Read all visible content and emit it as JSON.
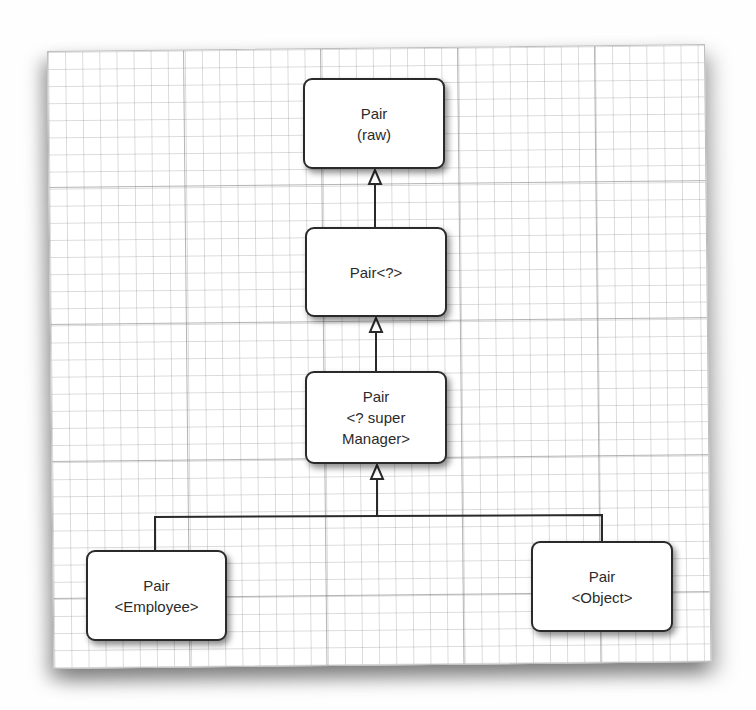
{
  "diagram": {
    "type": "class-hierarchy",
    "nodes": [
      {
        "id": "pair-raw",
        "lines": [
          "Pair",
          "(raw)"
        ]
      },
      {
        "id": "pair-wildcard",
        "lines": [
          "Pair<?>"
        ]
      },
      {
        "id": "pair-super-manager",
        "lines": [
          "Pair",
          "<? super",
          "Manager>"
        ]
      },
      {
        "id": "pair-employee",
        "lines": [
          "Pair",
          "<Employee>"
        ]
      },
      {
        "id": "pair-object",
        "lines": [
          "Pair",
          "<Object>"
        ]
      }
    ],
    "edges": [
      {
        "from": "pair-wildcard",
        "to": "pair-raw",
        "style": "generalization"
      },
      {
        "from": "pair-super-manager",
        "to": "pair-wildcard",
        "style": "generalization"
      },
      {
        "from": "pair-employee",
        "to": "pair-super-manager",
        "style": "generalization"
      },
      {
        "from": "pair-object",
        "to": "pair-super-manager",
        "style": "generalization"
      }
    ],
    "colors": {
      "line": "#2a2a2a",
      "box_fill": "#ffffff",
      "text": "#2b2b2b",
      "grid": "#9a9a9a"
    }
  }
}
